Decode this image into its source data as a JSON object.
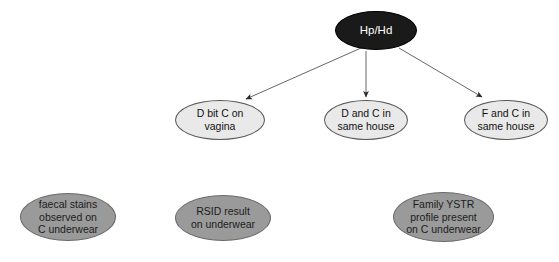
{
  "diagram": {
    "canvas": {
      "width": 559,
      "height": 262,
      "background": "#ffffff"
    },
    "colors": {
      "root_fill": "#1a1a1a",
      "root_text": "#ffffff",
      "hypothesis_fill": "#e9e9e9",
      "hypothesis_text": "#111111",
      "evidence_fill": "#9a9a9a",
      "evidence_text": "#1c1c1c",
      "edge": "#555555"
    },
    "nodes": {
      "root": {
        "label": "Hp/Hd"
      },
      "hypotheses": [
        {
          "label": "D bit C on\nvagina"
        },
        {
          "label": "D and C in\nsame house"
        },
        {
          "label": "F and C in\nsame house"
        }
      ],
      "evidence": [
        {
          "label": "faecal stains\nobserved on\nC underwear"
        },
        {
          "label": "RSID result\non underwear"
        },
        {
          "label": "Family YSTR\nprofile present\non C underwear"
        }
      ]
    },
    "edges": [
      {
        "from": "Hp/Hd",
        "to": "D bit C on vagina"
      },
      {
        "from": "Hp/Hd",
        "to": "D and C in same house"
      },
      {
        "from": "Hp/Hd",
        "to": "F and C in same house"
      }
    ]
  }
}
